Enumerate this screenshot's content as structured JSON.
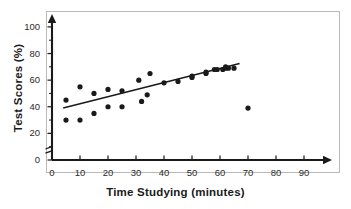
{
  "chart_data": {
    "type": "scatter",
    "title": "",
    "xlabel": "Time Studying (minutes)",
    "ylabel": "Test Scores (%)",
    "xlim": [
      0,
      95
    ],
    "ylim": [
      0,
      108
    ],
    "xticks": [
      0,
      10,
      20,
      30,
      40,
      50,
      60,
      70,
      80,
      90
    ],
    "yticks": [
      0,
      20,
      40,
      60,
      80,
      100
    ],
    "grid": false,
    "legend": null,
    "axis_break": true,
    "point_color": "#1a1a1a",
    "line_color": "#1a1a1a",
    "axis_color": "#1a1a1a",
    "series": [
      {
        "name": "Students",
        "marker": "circle",
        "points": [
          [
            5,
            45
          ],
          [
            5,
            30
          ],
          [
            10,
            55
          ],
          [
            10,
            30
          ],
          [
            15,
            50
          ],
          [
            15,
            35
          ],
          [
            20,
            53
          ],
          [
            20,
            40
          ],
          [
            25,
            52
          ],
          [
            25,
            40
          ],
          [
            31,
            60
          ],
          [
            32,
            44
          ],
          [
            34,
            49
          ],
          [
            35,
            65
          ],
          [
            40,
            58
          ],
          [
            45,
            59
          ],
          [
            50,
            62
          ],
          [
            50,
            63
          ],
          [
            55,
            65
          ],
          [
            55,
            66
          ],
          [
            58,
            68
          ],
          [
            59,
            68
          ],
          [
            61,
            68
          ],
          [
            62,
            69
          ],
          [
            62,
            70
          ],
          [
            63,
            69
          ],
          [
            65,
            69
          ],
          [
            70,
            39
          ]
        ]
      }
    ],
    "trendline": {
      "name": "line of best fit",
      "x_start": 4,
      "y_start": 39,
      "x_end": 67,
      "y_end": 72.5
    }
  },
  "axes": {
    "x_tick_labels": [
      "0",
      "10",
      "20",
      "30",
      "40",
      "50",
      "60",
      "70",
      "80",
      "90"
    ],
    "y_tick_labels": [
      "0",
      "20",
      "40",
      "60",
      "80",
      "100"
    ]
  }
}
